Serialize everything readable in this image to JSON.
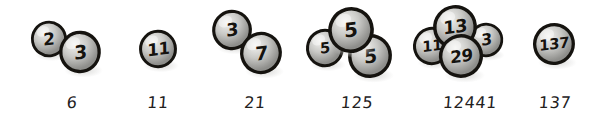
{
  "figure": {
    "background_color": "#ffffff",
    "ink_color": "#15130f",
    "ball_fill_light": "#f2f2f0",
    "ball_fill_mid": "#c9c9c6",
    "ball_fill_dark": "#8e8e8b",
    "shadow_color": "#d8d8d6"
  },
  "groups": [
    {
      "name": "group-6",
      "product_label": "6",
      "balls": [
        {
          "value": "2",
          "size": 38,
          "x": 8,
          "y": 20,
          "z": 2,
          "font_size": 17
        },
        {
          "value": "3",
          "size": 44,
          "x": 36,
          "y": 30,
          "z": 3,
          "font_size": 19
        }
      ]
    },
    {
      "name": "group-11",
      "product_label": "11",
      "balls": [
        {
          "value": "11",
          "size": 40,
          "x": 26,
          "y": 29,
          "z": 2,
          "font_size": 17
        }
      ]
    },
    {
      "name": "group-21",
      "product_label": "21",
      "balls": [
        {
          "value": "3",
          "size": 42,
          "x": 6,
          "y": 9,
          "z": 2,
          "font_size": 18
        },
        {
          "value": "7",
          "size": 44,
          "x": 34,
          "y": 31,
          "z": 3,
          "font_size": 19
        }
      ]
    },
    {
      "name": "group-125",
      "product_label": "125",
      "balls": [
        {
          "value": "5",
          "size": 40,
          "x": 0,
          "y": 28,
          "z": 1,
          "font_size": 15
        },
        {
          "value": "5",
          "size": 48,
          "x": 22,
          "y": 6,
          "z": 3,
          "font_size": 20
        },
        {
          "value": "5",
          "size": 46,
          "x": 42,
          "y": 33,
          "z": 2,
          "font_size": 19
        }
      ]
    },
    {
      "name": "group-12441",
      "product_label": "12441",
      "balls": [
        {
          "value": "11",
          "size": 40,
          "x": 0,
          "y": 26,
          "z": 1,
          "font_size": 15
        },
        {
          "value": "13",
          "size": 46,
          "x": 20,
          "y": 4,
          "z": 3,
          "font_size": 18
        },
        {
          "value": "3",
          "size": 36,
          "x": 56,
          "y": 22,
          "z": 2,
          "font_size": 16
        },
        {
          "value": "29",
          "size": 46,
          "x": 26,
          "y": 33,
          "z": 4,
          "font_size": 17
        }
      ]
    },
    {
      "name": "group-137",
      "product_label": "137",
      "balls": [
        {
          "value": "137",
          "size": 44,
          "x": 12,
          "y": 22,
          "z": 2,
          "font_size": 15
        }
      ]
    }
  ],
  "layout": {
    "group_positions": [
      {
        "left": 22,
        "width": 100
      },
      {
        "left": 112,
        "width": 92
      },
      {
        "left": 205,
        "width": 100
      },
      {
        "left": 305,
        "width": 104
      },
      {
        "left": 412,
        "width": 116
      },
      {
        "left": 520,
        "width": 70
      }
    ]
  }
}
